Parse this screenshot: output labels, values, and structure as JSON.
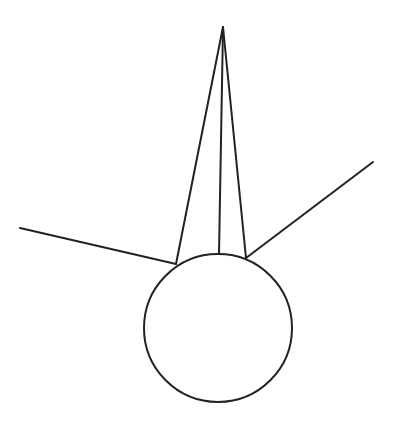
{
  "diagram": {
    "stroke_color": "#222222",
    "background": "#ffffff",
    "circle": {
      "cx": 218,
      "cy": 328,
      "r": 74
    },
    "apex": {
      "x": 223,
      "y": 27
    },
    "spike_lines": [
      {
        "x1": 223,
        "y1": 27,
        "x2": 176,
        "y2": 264
      },
      {
        "x1": 223,
        "y1": 27,
        "x2": 219,
        "y2": 254
      },
      {
        "x1": 223,
        "y1": 27,
        "x2": 246,
        "y2": 258
      }
    ],
    "side_lines": [
      {
        "x1": 20,
        "y1": 228,
        "x2": 176,
        "y2": 264
      },
      {
        "x1": 246,
        "y1": 258,
        "x2": 373,
        "y2": 162
      }
    ]
  }
}
